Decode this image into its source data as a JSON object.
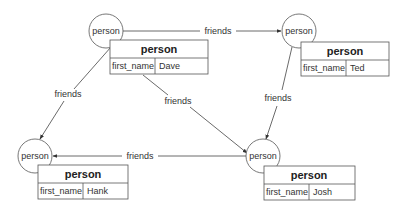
{
  "diagram": {
    "nodes": [
      {
        "id": "dave",
        "circle_label": "person",
        "table_title": "person",
        "field": "first_name",
        "value": "Dave"
      },
      {
        "id": "ted",
        "circle_label": "person",
        "table_title": "person",
        "field": "first_name",
        "value": "Ted"
      },
      {
        "id": "hank",
        "circle_label": "person",
        "table_title": "person",
        "field": "first_name",
        "value": "Hank"
      },
      {
        "id": "josh",
        "circle_label": "person",
        "table_title": "person",
        "field": "first_name",
        "value": "Josh"
      }
    ],
    "edges": [
      {
        "from": "dave",
        "to": "ted",
        "label": "friends"
      },
      {
        "from": "dave",
        "to": "hank",
        "label": "friends"
      },
      {
        "from": "dave",
        "to": "josh",
        "label": "friends"
      },
      {
        "from": "ted",
        "to": "josh",
        "label": "friends"
      },
      {
        "from": "josh",
        "to": "hank",
        "label": "friends"
      }
    ]
  },
  "colors": {
    "line": "#444444",
    "border": "#555555",
    "text": "#333333",
    "background": "#ffffff"
  }
}
